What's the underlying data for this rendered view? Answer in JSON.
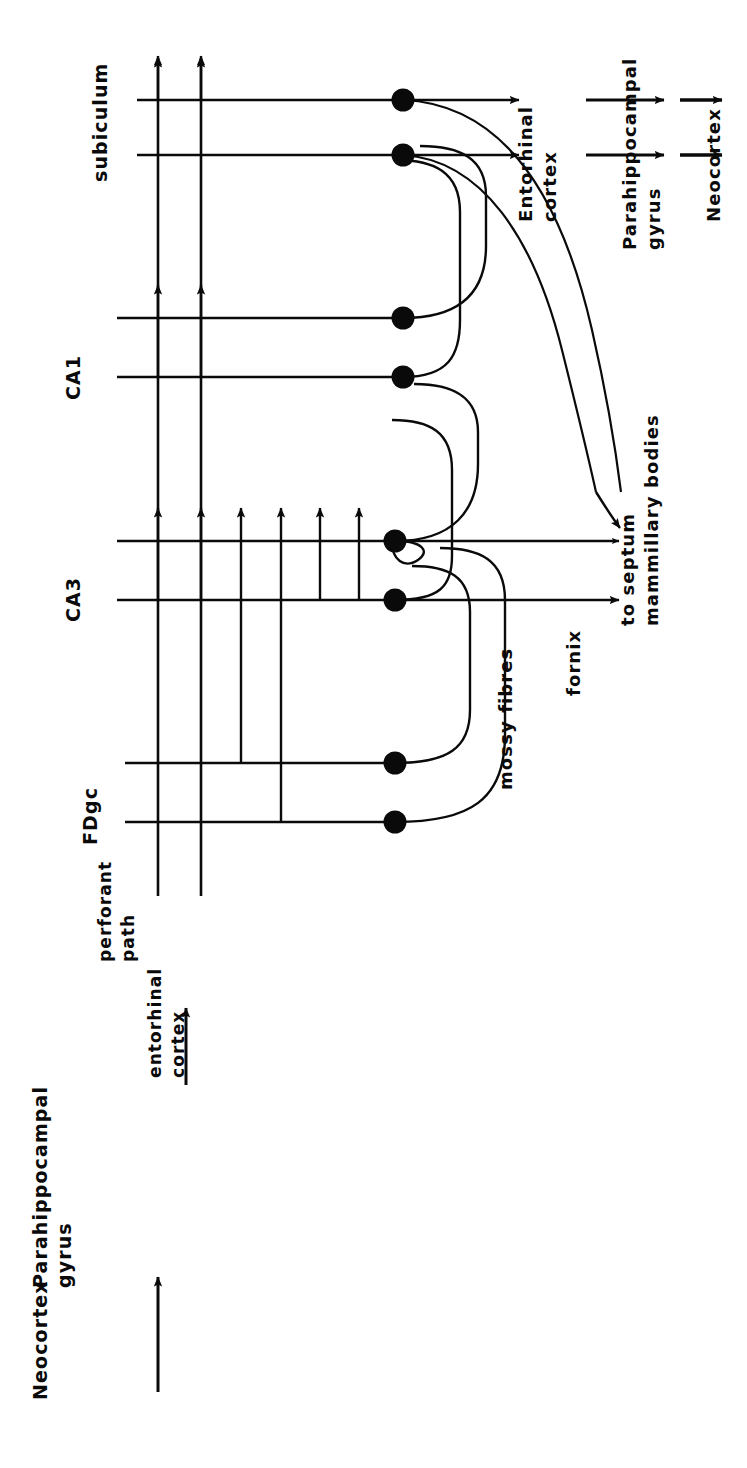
{
  "figure": {
    "type": "diagram",
    "orientation_deg": 90,
    "background_color": "#ffffff",
    "ink_color": "#0a0a0a"
  },
  "labels": {
    "neocortex_in": "Neocortex",
    "parahippocampal_gyrus_in_line1": "Parahippocampal",
    "parahippocampal_gyrus_in_line2": "gyrus",
    "entorhinal_cortex_in_line1": "entorhinal",
    "entorhinal_cortex_in_line2": "cortex",
    "perforant_path_line1": "perforant",
    "perforant_path_line2": "path",
    "fdgc": "FDgc",
    "ca3": "CA3",
    "ca1": "CA1",
    "subiculum": "subiculum",
    "mossy_fibres": "mossy fibres",
    "fornix": "fornix",
    "to_septum_line1": "to septum",
    "to_septum_line2": "mammillary bodies",
    "entorhinal_cortex_out_line1": "Entorhinal",
    "entorhinal_cortex_out_line2": "cortex",
    "parahippocampal_gyrus_out_line1": "Parahippocampal",
    "parahippocampal_gyrus_out_line2": "gyrus",
    "neocortex_out": "Neocortex"
  },
  "flow_stages": [
    "Neocortex",
    "Parahippocampal gyrus",
    "entorhinal cortex",
    "perforant path",
    "FDgc",
    "CA3",
    "CA1",
    "subiculum",
    "Entorhinal cortex",
    "Parahippocampal gyrus",
    "Neocortex"
  ],
  "output_pathways": [
    "mossy fibres",
    "fornix",
    "to septum mammillary bodies"
  ],
  "cell_bodies": {
    "count": 8,
    "radius_px": 11,
    "fill": "#0a0a0a",
    "groups": [
      "FDgc",
      "CA3",
      "CA1",
      "subiculum"
    ]
  }
}
